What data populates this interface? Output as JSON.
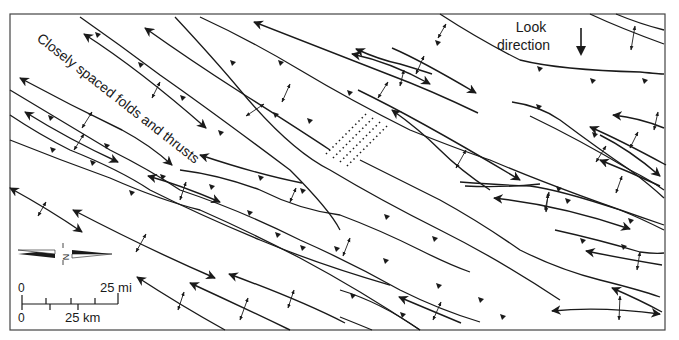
{
  "figure": {
    "kind": "structural geology sketch map",
    "frame": {
      "x": 10,
      "y": 14,
      "width": 655,
      "height": 316,
      "stroke": "#444444"
    }
  },
  "annotations": {
    "region_label": "Closely spaced folds and thrusts",
    "look_direction_line1": "Look",
    "look_direction_line2": "direction",
    "north_letter": "N"
  },
  "scale_bar": {
    "top_zero": "0",
    "top_end": "25 mi",
    "bottom_zero": "0",
    "bottom_end": "25 km"
  },
  "legend_symbols": {
    "thrust_fault": "line with triangular teeth",
    "fold_axis": "line with arrowheads",
    "fold_crest": "small double-headed arrow",
    "dotted_zone": "parallel dotted lines"
  },
  "colors": {
    "ink": "#1a1a1a",
    "background": "#ffffff"
  }
}
